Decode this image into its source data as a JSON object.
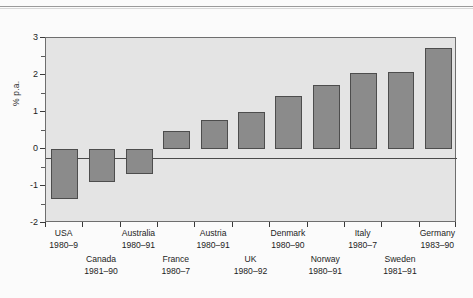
{
  "figure": {
    "background_color": "#e4e4e4",
    "bar_color": "#8b8b8b",
    "bar_edge_color": "#4d4d4d"
  },
  "chart_data": {
    "type": "bar",
    "title": "",
    "xlabel": "",
    "ylabel": "% p.a.",
    "ylim": [
      -2,
      3
    ],
    "yticks": [
      -2,
      -1,
      0,
      1,
      2,
      3
    ],
    "ytick_labels": [
      "-2",
      "-1",
      "0",
      "1",
      "2",
      "3"
    ],
    "yminor_ticks": [
      -1.5,
      -0.5,
      0.5,
      1.5,
      2.5
    ],
    "grid": false,
    "legend": "none",
    "categories": [
      "USA",
      "Canada",
      "Australia",
      "France",
      "Austria",
      "UK",
      "Denmark",
      "Norway",
      "Italy",
      "Sweden",
      "Germany"
    ],
    "periods": [
      "1980–9",
      "1981–90",
      "1980–91",
      "1980–7",
      "1980–91",
      "1980–92",
      "1980–90",
      "1980–91",
      "1980–7",
      "1981–91",
      "1983–90"
    ],
    "values": [
      -1.35,
      -0.9,
      -0.68,
      0.48,
      0.78,
      1.0,
      1.43,
      1.73,
      2.05,
      2.07,
      2.72
    ]
  }
}
